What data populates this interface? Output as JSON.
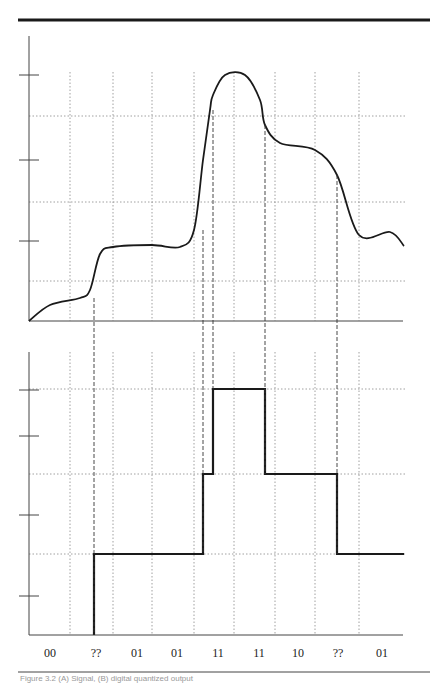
{
  "figure": {
    "caption": "Figure 3.2  (A) Signal, (B) digital quantized output",
    "top_rule": true,
    "bottom_rule": true
  },
  "chart_data": [
    {
      "type": "line",
      "title": "",
      "xlabel": "",
      "ylabel": "",
      "description": "Continuous analog signal (upper panel)",
      "grid": true,
      "x": [
        29,
        50,
        80,
        90,
        100,
        113,
        152,
        180,
        194,
        203,
        210,
        213,
        225,
        245,
        260,
        265,
        280,
        315,
        337,
        359,
        390,
        404
      ],
      "y_pixels": [
        321,
        305,
        298,
        290,
        254,
        247,
        245,
        247,
        230,
        160,
        110,
        95,
        75,
        75,
        100,
        125,
        143,
        150,
        175,
        235,
        232,
        246
      ],
      "y_ticks_px": [
        75,
        160,
        241
      ],
      "h_grid_px": [
        116,
        202,
        281
      ],
      "v_grid_px": [
        70,
        113,
        152,
        194,
        234,
        275,
        315,
        359
      ],
      "annotation_dashed_x_px": [
        94,
        203,
        213,
        265,
        337
      ]
    },
    {
      "type": "line",
      "step": true,
      "title": "",
      "xlabel": "",
      "ylabel": "",
      "description": "Quantized 2-bit digital output (lower panel)",
      "grid": true,
      "levels": {
        "00": 635,
        "01": 554,
        "10": 474,
        "11": 389
      },
      "segments": [
        {
          "x0": 29,
          "x1": 94,
          "level": "00"
        },
        {
          "x0": 94,
          "x1": 203,
          "level": "01"
        },
        {
          "x0": 203,
          "x1": 213,
          "level": "10"
        },
        {
          "x0": 213,
          "x1": 265,
          "level": "11"
        },
        {
          "x0": 265,
          "x1": 337,
          "level": "10"
        },
        {
          "x0": 337,
          "x1": 404,
          "level": "01"
        }
      ],
      "y_ticks_px": [
        390,
        436,
        515,
        596
      ],
      "h_grid_px": [
        389,
        474,
        554
      ],
      "categories": [
        "00",
        "??",
        "01",
        "01",
        "11",
        "11",
        "10",
        "??",
        "01"
      ]
    }
  ],
  "code_labels": [
    {
      "x": 50,
      "text": "00"
    },
    {
      "x": 96,
      "text": "??"
    },
    {
      "x": 137,
      "text": "01"
    },
    {
      "x": 177,
      "text": "01"
    },
    {
      "x": 218,
      "text": "11"
    },
    {
      "x": 259,
      "text": "11"
    },
    {
      "x": 298,
      "text": "10"
    },
    {
      "x": 338,
      "text": "??"
    },
    {
      "x": 382,
      "text": "01"
    }
  ],
  "colors": {
    "ink": "#1a1a1a",
    "grid": "#888888",
    "axis": "#444444"
  }
}
